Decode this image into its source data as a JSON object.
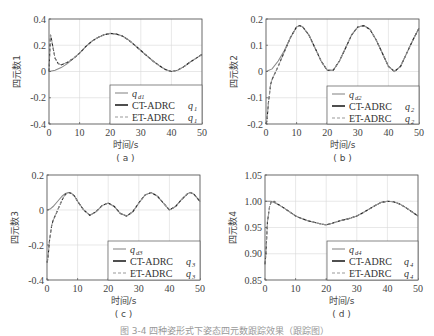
{
  "figure_caption": "图 3-4  四种姿形式下姿态四元数跟踪效果（跟踪图）",
  "colors": {
    "reference": "#8a8a8a",
    "ct_adrc": "#222222",
    "et_adrc": "#9a9a9a",
    "grid": "#d8d8d8",
    "frame": "#555555"
  },
  "chart_data": [
    {
      "id": "a",
      "type": "line",
      "subplot_label": "( a )",
      "xlabel": "时间/s",
      "ylabel": "四元数1",
      "xlim": [
        0,
        50
      ],
      "ylim": [
        -0.4,
        0.4
      ],
      "xticks": [
        0,
        10,
        20,
        30,
        40,
        50
      ],
      "yticks": [
        -0.4,
        -0.2,
        0,
        0.2,
        0.4
      ],
      "ytick_labels": [
        "-0.4",
        "-0.2",
        "0",
        "0.2",
        "0.4"
      ],
      "grid": true,
      "legend": {
        "position": "lower right",
        "entries": [
          {
            "text": "",
            "sym": "q",
            "sub": "d1",
            "style": "reference"
          },
          {
            "text": "CT-ADRC",
            "sym": "q",
            "sub": "1",
            "style": "ct_adrc"
          },
          {
            "text": "ET-ADRC",
            "sym": "q",
            "sub": "1",
            "style": "et_adrc"
          }
        ]
      },
      "series": [
        {
          "name": "q_d1",
          "x": [
            0,
            2,
            4,
            6,
            8,
            10,
            12,
            14,
            16,
            18,
            20,
            22,
            24,
            26,
            28,
            30,
            32,
            34,
            36,
            38,
            40,
            42,
            44,
            46,
            48,
            50
          ],
          "y": [
            0,
            0.01,
            0.03,
            0.06,
            0.1,
            0.14,
            0.19,
            0.23,
            0.26,
            0.28,
            0.29,
            0.285,
            0.27,
            0.24,
            0.2,
            0.16,
            0.12,
            0.08,
            0.045,
            0.015,
            0.0,
            0.01,
            0.035,
            0.07,
            0.1,
            0.13
          ]
        },
        {
          "name": "CT-ADRC q1",
          "x": [
            0,
            0.5,
            1,
            2,
            3,
            4,
            6,
            8,
            10,
            12,
            14,
            16,
            18,
            20,
            22,
            24,
            26,
            28,
            30,
            32,
            34,
            36,
            38,
            40,
            42,
            44,
            46,
            48,
            50
          ],
          "y": [
            0,
            0.28,
            0.22,
            0.1,
            0.06,
            0.05,
            0.07,
            0.1,
            0.14,
            0.19,
            0.23,
            0.26,
            0.28,
            0.29,
            0.285,
            0.27,
            0.24,
            0.2,
            0.16,
            0.12,
            0.08,
            0.045,
            0.015,
            0.0,
            0.01,
            0.035,
            0.07,
            0.1,
            0.13
          ]
        },
        {
          "name": "ET-ADRC q1",
          "x": [
            0,
            0.5,
            1,
            2,
            3,
            4,
            6,
            8,
            10,
            12,
            14,
            16,
            18,
            20,
            22,
            24,
            26,
            28,
            30,
            32,
            34,
            36,
            38,
            40,
            42,
            44,
            46,
            48,
            50
          ],
          "y": [
            0,
            0.28,
            0.22,
            0.1,
            0.06,
            0.05,
            0.07,
            0.1,
            0.14,
            0.19,
            0.23,
            0.26,
            0.28,
            0.29,
            0.285,
            0.27,
            0.24,
            0.2,
            0.16,
            0.12,
            0.08,
            0.045,
            0.015,
            0.0,
            0.01,
            0.035,
            0.07,
            0.1,
            0.13
          ]
        }
      ]
    },
    {
      "id": "b",
      "type": "line",
      "subplot_label": "( b )",
      "xlabel": "时间/s",
      "ylabel": "四元数2",
      "xlim": [
        0,
        50
      ],
      "ylim": [
        -0.2,
        0.2
      ],
      "xticks": [
        0,
        10,
        20,
        30,
        40,
        50
      ],
      "yticks": [
        -0.2,
        -0.1,
        0,
        0.1,
        0.2
      ],
      "ytick_labels": [
        "-0.2",
        "-0.1",
        "0",
        "0.1",
        "0.2"
      ],
      "grid": true,
      "legend": {
        "position": "lower right",
        "entries": [
          {
            "text": "",
            "sym": "q",
            "sub": "d2",
            "style": "reference"
          },
          {
            "text": "CT-ADRC",
            "sym": "q",
            "sub": "2",
            "style": "ct_adrc"
          },
          {
            "text": "ET-ADRC",
            "sym": "q",
            "sub": "2",
            "style": "et_adrc"
          }
        ]
      },
      "series": [
        {
          "name": "q_d2",
          "x": [
            0,
            2,
            4,
            6,
            8,
            10,
            11,
            12,
            14,
            16,
            18,
            20,
            22,
            24,
            26,
            28,
            30,
            32,
            34,
            36,
            38,
            40,
            42,
            44,
            46,
            48,
            50
          ],
          "y": [
            0,
            0.01,
            0.04,
            0.08,
            0.13,
            0.17,
            0.175,
            0.17,
            0.14,
            0.09,
            0.04,
            0.005,
            0.005,
            0.04,
            0.09,
            0.14,
            0.17,
            0.175,
            0.16,
            0.12,
            0.07,
            0.02,
            0.0,
            0.02,
            0.07,
            0.12,
            0.165
          ]
        },
        {
          "name": "CT-ADRC q2",
          "x": [
            0,
            0.3,
            0.8,
            1.5,
            2,
            3,
            4,
            6,
            8,
            10,
            11,
            12,
            14,
            16,
            18,
            20,
            22,
            24,
            26,
            28,
            30,
            32,
            34,
            36,
            38,
            40,
            42,
            44,
            46,
            48,
            50
          ],
          "y": [
            -0.2,
            -0.19,
            -0.12,
            -0.05,
            -0.03,
            -0.005,
            0.02,
            0.075,
            0.13,
            0.17,
            0.175,
            0.17,
            0.14,
            0.09,
            0.04,
            0.005,
            0.005,
            0.04,
            0.09,
            0.14,
            0.17,
            0.175,
            0.16,
            0.12,
            0.07,
            0.02,
            0.0,
            0.02,
            0.07,
            0.12,
            0.165
          ]
        },
        {
          "name": "ET-ADRC q2",
          "x": [
            0,
            0.3,
            0.8,
            1.5,
            2,
            3,
            4,
            6,
            8,
            10,
            11,
            12,
            14,
            16,
            18,
            20,
            22,
            24,
            26,
            28,
            30,
            32,
            34,
            36,
            38,
            40,
            42,
            44,
            46,
            48,
            50
          ],
          "y": [
            -0.2,
            -0.19,
            -0.12,
            -0.05,
            -0.03,
            -0.005,
            0.02,
            0.075,
            0.13,
            0.17,
            0.175,
            0.17,
            0.14,
            0.09,
            0.04,
            0.005,
            0.005,
            0.04,
            0.09,
            0.14,
            0.17,
            0.175,
            0.16,
            0.12,
            0.07,
            0.02,
            0.0,
            0.02,
            0.07,
            0.12,
            0.165
          ]
        }
      ]
    },
    {
      "id": "c",
      "type": "line",
      "subplot_label": "( c )",
      "xlabel": "时间/s",
      "ylabel": "四元数3",
      "xlim": [
        0,
        50
      ],
      "ylim": [
        -0.4,
        0.2
      ],
      "xticks": [
        0,
        10,
        20,
        30,
        40,
        50
      ],
      "yticks": [
        -0.4,
        -0.2,
        0,
        0.2
      ],
      "ytick_labels": [
        "-0.4",
        "-0.2",
        "0",
        "0.2"
      ],
      "grid": true,
      "legend": {
        "position": "lower right",
        "entries": [
          {
            "text": "",
            "sym": "q",
            "sub": "d3",
            "style": "reference"
          },
          {
            "text": "CT-ADRC",
            "sym": "q",
            "sub": "3",
            "style": "ct_adrc"
          },
          {
            "text": "ET-ADRC",
            "sym": "q",
            "sub": "3",
            "style": "et_adrc"
          }
        ]
      },
      "series": [
        {
          "name": "q_d3",
          "x": [
            0,
            1,
            2,
            3,
            4,
            5,
            6,
            7,
            8,
            9,
            10,
            12,
            14,
            16,
            18,
            20,
            22,
            24,
            26,
            28,
            30,
            32,
            34,
            36,
            38,
            40,
            42,
            44,
            46,
            47,
            48,
            50
          ],
          "y": [
            0,
            0.005,
            0.02,
            0.04,
            0.06,
            0.08,
            0.095,
            0.1,
            0.095,
            0.08,
            0.05,
            0.0,
            -0.03,
            -0.01,
            0.025,
            0.04,
            0.02,
            -0.02,
            -0.035,
            -0.01,
            0.04,
            0.085,
            0.1,
            0.08,
            0.04,
            0.0,
            0.02,
            0.06,
            0.095,
            0.1,
            0.09,
            0.05
          ]
        },
        {
          "name": "CT-ADRC q3",
          "x": [
            0,
            0.3,
            0.8,
            1.5,
            2,
            3,
            4,
            5,
            6,
            7,
            8,
            9,
            10,
            12,
            14,
            16,
            18,
            20,
            22,
            24,
            26,
            28,
            30,
            32,
            34,
            36,
            38,
            40,
            42,
            44,
            46,
            47,
            48,
            50
          ],
          "y": [
            -0.3,
            -0.28,
            -0.18,
            -0.09,
            -0.06,
            -0.02,
            0.02,
            0.06,
            0.09,
            0.1,
            0.095,
            0.08,
            0.05,
            0.0,
            -0.03,
            -0.01,
            0.025,
            0.04,
            0.02,
            -0.02,
            -0.035,
            -0.01,
            0.04,
            0.085,
            0.1,
            0.08,
            0.04,
            0.0,
            0.02,
            0.06,
            0.095,
            0.1,
            0.09,
            0.05
          ]
        },
        {
          "name": "ET-ADRC q3",
          "x": [
            0,
            0.3,
            0.8,
            1.5,
            2,
            3,
            4,
            5,
            6,
            7,
            8,
            9,
            10,
            12,
            14,
            16,
            18,
            20,
            22,
            24,
            26,
            28,
            30,
            32,
            34,
            36,
            38,
            40,
            42,
            44,
            46,
            47,
            48,
            50
          ],
          "y": [
            -0.3,
            -0.28,
            -0.18,
            -0.09,
            -0.06,
            -0.02,
            0.02,
            0.06,
            0.09,
            0.1,
            0.095,
            0.08,
            0.05,
            0.0,
            -0.03,
            -0.01,
            0.025,
            0.04,
            0.02,
            -0.02,
            -0.035,
            -0.01,
            0.04,
            0.085,
            0.1,
            0.08,
            0.04,
            0.0,
            0.02,
            0.06,
            0.095,
            0.1,
            0.09,
            0.05
          ]
        }
      ]
    },
    {
      "id": "d",
      "type": "line",
      "subplot_label": "( d )",
      "xlabel": "时间/s",
      "ylabel": "四元数4",
      "xlim": [
        0,
        50
      ],
      "ylim": [
        0.85,
        1.05
      ],
      "xticks": [
        0,
        10,
        20,
        30,
        40,
        50
      ],
      "yticks": [
        0.85,
        0.9,
        0.95,
        1.0,
        1.05
      ],
      "ytick_labels": [
        "0.85",
        "0.90",
        "0.95",
        "1.00",
        "1.05"
      ],
      "grid": true,
      "legend": {
        "position": "lower right",
        "entries": [
          {
            "text": "",
            "sym": "q",
            "sub": "d4",
            "style": "reference"
          },
          {
            "text": "CT-ADRC",
            "sym": "q",
            "sub": "4",
            "style": "ct_adrc"
          },
          {
            "text": "ET-ADRC",
            "sym": "q",
            "sub": "4",
            "style": "et_adrc"
          }
        ]
      },
      "series": [
        {
          "name": "q_d4",
          "x": [
            0,
            2,
            4,
            6,
            8,
            10,
            12,
            14,
            16,
            18,
            20,
            22,
            24,
            26,
            28,
            30,
            32,
            34,
            36,
            38,
            40,
            42,
            44,
            46,
            48,
            50
          ],
          "y": [
            1.0,
            1.0,
            0.995,
            0.988,
            0.98,
            0.972,
            0.967,
            0.963,
            0.96,
            0.957,
            0.955,
            0.958,
            0.962,
            0.965,
            0.968,
            0.972,
            0.978,
            0.985,
            0.992,
            0.998,
            1.0,
            0.999,
            0.995,
            0.988,
            0.98,
            0.972
          ]
        },
        {
          "name": "CT-ADRC q4",
          "x": [
            0,
            0.3,
            0.8,
            1.5,
            2,
            3,
            4,
            6,
            8,
            10,
            12,
            14,
            16,
            18,
            20,
            22,
            24,
            26,
            28,
            30,
            32,
            34,
            36,
            38,
            40,
            42,
            44,
            46,
            48,
            50
          ],
          "y": [
            0.88,
            0.9,
            0.96,
            0.99,
            0.998,
            1.0,
            0.995,
            0.988,
            0.98,
            0.972,
            0.967,
            0.963,
            0.96,
            0.957,
            0.955,
            0.958,
            0.962,
            0.965,
            0.968,
            0.972,
            0.978,
            0.985,
            0.992,
            0.998,
            1.0,
            0.999,
            0.995,
            0.988,
            0.98,
            0.972
          ]
        },
        {
          "name": "ET-ADRC q4",
          "x": [
            0,
            0.3,
            0.8,
            1.5,
            2,
            3,
            4,
            6,
            8,
            10,
            12,
            14,
            16,
            18,
            20,
            22,
            24,
            26,
            28,
            30,
            32,
            34,
            36,
            38,
            40,
            42,
            44,
            46,
            48,
            50
          ],
          "y": [
            0.88,
            0.9,
            0.96,
            0.99,
            0.998,
            1.0,
            0.995,
            0.988,
            0.98,
            0.972,
            0.967,
            0.963,
            0.96,
            0.957,
            0.955,
            0.958,
            0.962,
            0.965,
            0.968,
            0.972,
            0.978,
            0.985,
            0.992,
            0.998,
            1.0,
            0.999,
            0.995,
            0.988,
            0.98,
            0.972
          ]
        }
      ]
    }
  ]
}
